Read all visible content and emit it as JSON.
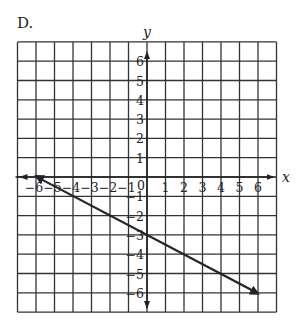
{
  "problem": {
    "label": "D."
  },
  "chart_data": {
    "type": "line",
    "title": "D.",
    "xlabel": "x",
    "ylabel": "y",
    "xlim": [
      -7,
      7
    ],
    "ylim": [
      -7,
      7
    ],
    "grid": true,
    "x_ticks": [
      -6,
      -5,
      -4,
      -3,
      -2,
      -1,
      0,
      1,
      2,
      3,
      4,
      5,
      6
    ],
    "y_ticks": [
      -6,
      -5,
      -4,
      -3,
      -2,
      -1,
      1,
      2,
      3,
      4,
      5,
      6
    ],
    "origin_label": "0",
    "series": [
      {
        "name": "line",
        "points": [
          [
            -6,
            0
          ],
          [
            0,
            -3
          ],
          [
            6,
            -6
          ]
        ],
        "slope": -0.5,
        "intercept": -3,
        "arrows_at_ends": true
      }
    ]
  },
  "colors": {
    "grid": "#333333",
    "axis": "#222222",
    "line": "#222222",
    "background": "#ffffff"
  }
}
